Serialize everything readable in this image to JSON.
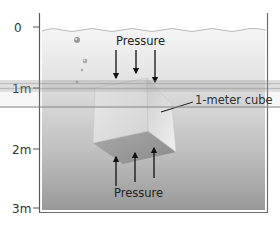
{
  "diagram": {
    "depth_axis": {
      "ticks": [
        {
          "label": "0",
          "y": 27
        },
        {
          "label": "1m",
          "y": 88
        },
        {
          "label": "2m",
          "y": 149
        },
        {
          "label": "3m",
          "y": 208
        }
      ]
    },
    "labels": {
      "pressure_top": "Pressure",
      "pressure_bottom": "Pressure",
      "cube": "1-meter cube"
    },
    "colors": {
      "water_top": "#f4f4f4",
      "water_bottom": "#9c9c9c",
      "tank_outline": "#6e6e6e",
      "arrow": "#111111",
      "band": "#8a8a8a"
    }
  }
}
